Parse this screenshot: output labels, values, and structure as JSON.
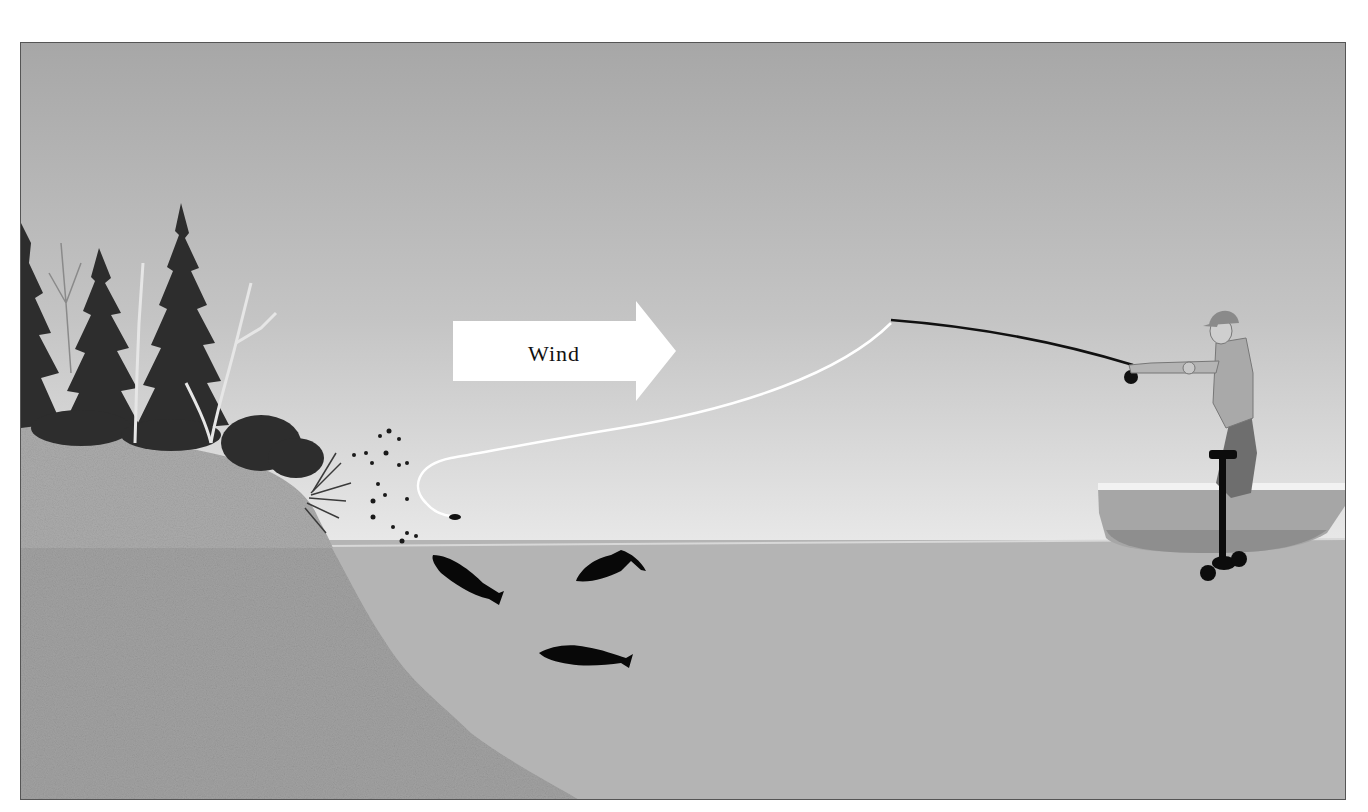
{
  "illustration": {
    "subject": "Fly fishing from a boat, casting toward a wooded shoreline downwind",
    "wind_arrow": {
      "label": "Wind",
      "direction": "right"
    },
    "colors": {
      "sky_top": "#a9a9a9",
      "sky_bottom": "#e6e6e6",
      "water": "#b5b5b5",
      "bank": "#a3a3a3",
      "trees": "#2e2e2e",
      "fish": "#0a0a0a",
      "fly_line": "#ffffff",
      "rod": "#111111",
      "frame_border": "#555555"
    },
    "elements": {
      "fish_count": 3,
      "insects": "scattered insects blown off the shoreline",
      "angler": "man in cap and vest standing in small boat",
      "motor": "electric trolling motor mounted on boat"
    }
  }
}
